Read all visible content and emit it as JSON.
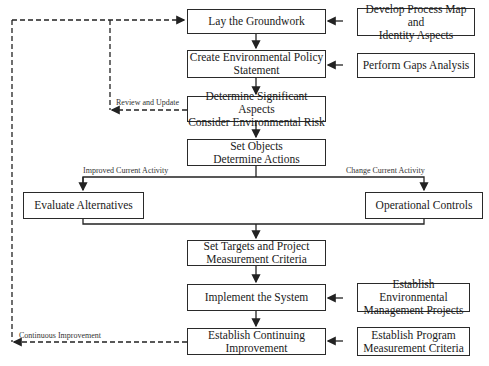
{
  "diagram": {
    "main_steps": [
      {
        "id": "step1",
        "label": "Lay the Groundwork"
      },
      {
        "id": "step2",
        "label": "Create Environmental Policy Statement"
      },
      {
        "id": "step3",
        "label": "Determine Significant Aspects Consider Environmental Risk"
      },
      {
        "id": "step4",
        "label": "Set Objects Determine Actions"
      },
      {
        "id": "step5",
        "label": "Set Targets and Project Measurement Criteria"
      },
      {
        "id": "step6",
        "label": "Implement the System"
      },
      {
        "id": "step7",
        "label": "Establish Continuing Improvement"
      }
    ],
    "main_lines": {
      "step2": [
        "Create Environmental Policy",
        "Statement"
      ],
      "step3": [
        "Determine Significant Aspects",
        "Consider Environmental Risk"
      ],
      "step4": [
        "Set Objects",
        "Determine Actions"
      ],
      "step5": [
        "Set Targets and Project",
        "Measurement Criteria"
      ],
      "step7": [
        "Establish Continuing",
        "Improvement"
      ]
    },
    "inputs": {
      "process_map": [
        "Develop Process Map and",
        "Identity Aspects"
      ],
      "gaps": "Perform Gaps Analysis",
      "env_projects": [
        "Establish Environmental",
        "Management Projects"
      ],
      "program_criteria": [
        "Establish Program",
        "Measurement Criteria"
      ]
    },
    "branches": {
      "left": {
        "label": "Improved Current Activity",
        "box": "Evaluate Alternatives"
      },
      "right": {
        "label": "Change Current Activity",
        "box": "Operational Controls"
      }
    },
    "feedback": {
      "review": "Review and Update",
      "continuous": "Continuous Improvement"
    }
  }
}
